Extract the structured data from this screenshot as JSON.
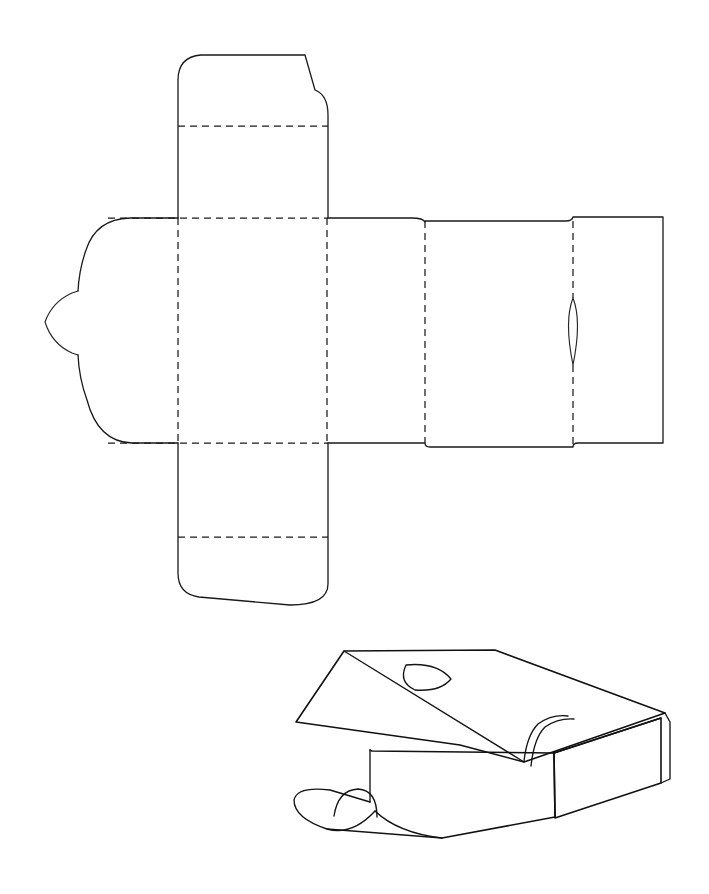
{
  "document": {
    "title": "Box Dieline Template",
    "background_color": "#ffffff",
    "line_color": "#1a1a1a",
    "width": 709,
    "height": 894
  },
  "figures": [
    {
      "id": "dieline",
      "name": "flat-dieline",
      "caption": "Flat unfolded box dieline with fold lines and cut lines"
    },
    {
      "id": "assembled",
      "name": "assembled-box-3d",
      "caption": "Three-quarter perspective view of assembled open box"
    }
  ],
  "dieline": {
    "parts": [
      {
        "name": "top-flap",
        "type": "cut",
        "description": "Upper closure flap with angled top edge and rounded corners"
      },
      {
        "name": "top-flap-fold",
        "type": "fold",
        "description": "Dashed score line across top flap"
      },
      {
        "name": "top-panel-fold",
        "type": "fold",
        "description": "Dashed score between top flap and center panel"
      },
      {
        "name": "center-panel",
        "type": "panel",
        "description": "Main base panel bounded by four dashed score lines"
      },
      {
        "name": "left-rounded-flap",
        "type": "cut",
        "description": "Rounded left side flap"
      },
      {
        "name": "left-tongue-tab",
        "type": "cut",
        "description": "Small pointed locking tongue on far left"
      },
      {
        "name": "bottom-flap",
        "type": "cut",
        "description": "Lower closure flap with angled bottom edge and rounded corners"
      },
      {
        "name": "bottom-flap-fold",
        "type": "fold",
        "description": "Dashed score line across bottom flap"
      },
      {
        "name": "bottom-panel-fold",
        "type": "fold",
        "description": "Dashed score between center panel and bottom flap"
      },
      {
        "name": "side-wall-panel",
        "type": "panel",
        "description": "Right side wall panel"
      },
      {
        "name": "lid-panel",
        "type": "panel",
        "description": "Lid panel to the right of side wall"
      },
      {
        "name": "lid-tuck-panel",
        "type": "panel",
        "description": "Far right tuck panel"
      },
      {
        "name": "thumb-cutout",
        "type": "cut",
        "description": "Lens-shaped thumb notch straddling the lid fold line"
      }
    ],
    "fold_lines": [
      {
        "name": "vertical-fold-left",
        "x": 178,
        "y1": 218,
        "y2": 443
      },
      {
        "name": "vertical-fold-center",
        "x": 327,
        "y1": 218,
        "y2": 443
      },
      {
        "name": "vertical-fold-right",
        "x": 425,
        "y1": 218,
        "y2": 443
      },
      {
        "name": "vertical-fold-lid",
        "x": 573,
        "y1": 221,
        "y2": 443
      },
      {
        "name": "horizontal-fold-top",
        "y": 218,
        "x1": 108,
        "x2": 327
      },
      {
        "name": "horizontal-fold-bottom",
        "y": 443,
        "x1": 108,
        "x2": 327
      },
      {
        "name": "horizontal-fold-top-flap",
        "y": 126,
        "x1": 178,
        "x2": 327
      },
      {
        "name": "horizontal-fold-bottom-flap",
        "y": 537,
        "x1": 178,
        "x2": 327
      }
    ],
    "thumb_cutout": {
      "center_x": 573,
      "top_y": 298,
      "bottom_y": 365,
      "half_width": 9
    }
  },
  "assembled": {
    "parts": [
      {
        "name": "lid-top-face",
        "description": "Raised open lid seen from above"
      },
      {
        "name": "lid-thumb-hole",
        "description": "Oval thumb hole on lid"
      },
      {
        "name": "box-right-side-wall",
        "description": "Right side wall of the box body"
      },
      {
        "name": "box-front-wall",
        "description": "Front wall of the box body"
      },
      {
        "name": "box-inner-flap",
        "description": "Inner tucked end flap visible at right"
      },
      {
        "name": "front-tongue-tab",
        "description": "Rounded tongue tab at front left"
      }
    ]
  }
}
